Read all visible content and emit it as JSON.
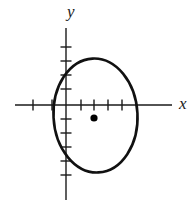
{
  "figure": {
    "kind": "coordinate-plane-with-ellipse",
    "width": 194,
    "height": 211,
    "background_color": "#ffffff",
    "stroke_color": "#1a1a1a"
  },
  "axes": {
    "x_axis": {
      "label": "x",
      "label_x": 179,
      "label_y": 109,
      "label_font_size": 17,
      "line_y": 105,
      "line_x_start": 15,
      "line_x_end": 172,
      "stroke_width": 1.4
    },
    "y_axis": {
      "label": "y",
      "label_x": 67,
      "label_y": 17,
      "label_font_size": 17,
      "line_x": 66,
      "line_y_start": 28,
      "line_y_end": 200,
      "stroke_width": 1.4
    },
    "origin": {
      "x": 66,
      "y": 105
    },
    "tick_length": 11,
    "tick_stroke_width": 1.4,
    "x_ticks": [
      33,
      52,
      81,
      94,
      108,
      122
    ],
    "y_ticks": [
      47,
      61,
      75,
      89,
      119,
      133,
      147,
      161,
      175
    ]
  },
  "ellipse": {
    "center_x": 95.5,
    "center_y": 115.5,
    "radius_x": 42,
    "radius_y": 57,
    "rotation_deg": -3,
    "stroke_color": "#111111",
    "stroke_width": 2.6,
    "fill": "none"
  },
  "center_point": {
    "label": "center-dot",
    "x": 94,
    "y": 118,
    "radius": 3.6,
    "color": "#000000"
  }
}
